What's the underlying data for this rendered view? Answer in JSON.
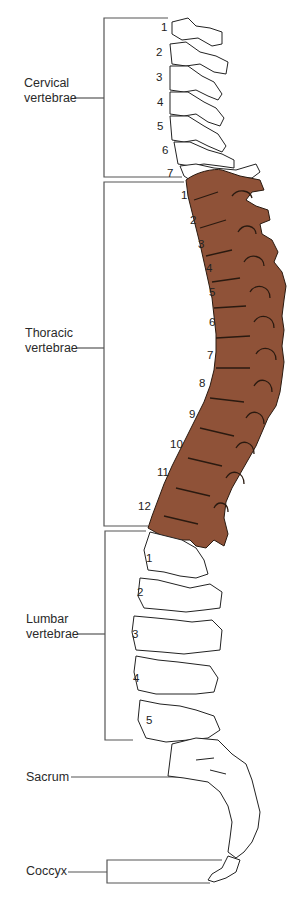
{
  "colors": {
    "background": "#ffffff",
    "thoracic_fill": "#8f5238",
    "bone_fill": "#ffffff",
    "outline": "#222222",
    "bracket_line": "#555555"
  },
  "regions": [
    {
      "name": "cervical",
      "label_line1": "Cervical",
      "label_line2": "vertebrae",
      "numbers": [
        "1",
        "2",
        "3",
        "4",
        "5",
        "6",
        "7"
      ],
      "highlighted": false
    },
    {
      "name": "thoracic",
      "label_line1": "Thoracic",
      "label_line2": "vertebrae",
      "numbers": [
        "1",
        "2",
        "3",
        "4",
        "5",
        "6",
        "7",
        "8",
        "9",
        "10",
        "11",
        "12"
      ],
      "highlighted": true
    },
    {
      "name": "lumbar",
      "label_line1": "Lumbar",
      "label_line2": "vertebrae",
      "numbers": [
        "1",
        "2",
        "3",
        "4",
        "5"
      ],
      "highlighted": false
    },
    {
      "name": "sacrum",
      "label_line1": "Sacrum",
      "highlighted": false
    },
    {
      "name": "coccyx",
      "label_line1": "Coccyx",
      "highlighted": false
    }
  ]
}
